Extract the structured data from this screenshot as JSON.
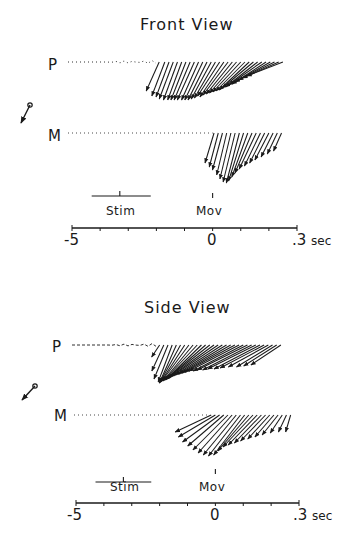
{
  "chart_data": [
    {
      "type": "vector-time-series",
      "title": "Front View",
      "rows": [
        {
          "label": "P",
          "baseline": "dotted, noisy before movement",
          "arrow_onset_sec": -0.2,
          "arrow_end_sec": 0.25,
          "arrows": [
            [
              -0.19,
              13,
              29
            ],
            [
              -0.17,
              13,
              34
            ],
            [
              -0.155,
              13,
              35
            ],
            [
              -0.14,
              14,
              37
            ],
            [
              -0.125,
              14,
              38
            ],
            [
              -0.11,
              14,
              38
            ],
            [
              -0.095,
              15,
              38
            ],
            [
              -0.08,
              16,
              38
            ],
            [
              -0.065,
              17,
              38
            ],
            [
              -0.05,
              17,
              38
            ],
            [
              -0.035,
              18,
              38
            ],
            [
              -0.02,
              19,
              38
            ],
            [
              -0.005,
              20,
              37
            ],
            [
              0.01,
              21,
              36
            ],
            [
              0.025,
              22,
              34
            ],
            [
              0.04,
              24,
              35
            ],
            [
              0.055,
              25,
              33
            ],
            [
              0.07,
              26,
              32
            ],
            [
              0.085,
              27,
              31
            ],
            [
              0.1,
              28,
              30
            ],
            [
              0.115,
              29,
              29
            ],
            [
              0.13,
              30,
              28
            ],
            [
              0.145,
              31,
              26
            ],
            [
              0.16,
              32,
              25
            ],
            [
              0.175,
              33,
              23
            ],
            [
              0.19,
              34,
              22
            ],
            [
              0.205,
              35,
              20
            ],
            [
              0.22,
              36,
              18
            ],
            [
              0.235,
              36,
              16
            ],
            [
              0.25,
              36,
              14
            ]
          ]
        },
        {
          "label": "M",
          "baseline": "dotted",
          "arrow_onset_sec": 0.0,
          "arrow_end_sec": 0.25,
          "arrows": [
            [
              0.005,
              9,
              30
            ],
            [
              0.02,
              9,
              34
            ],
            [
              0.035,
              10,
              37
            ],
            [
              0.05,
              10,
              42
            ],
            [
              0.065,
              11,
              46
            ],
            [
              0.08,
              12,
              49
            ],
            [
              0.095,
              13,
              50
            ],
            [
              0.11,
              15,
              48
            ],
            [
              0.125,
              16,
              44
            ],
            [
              0.14,
              17,
              40
            ],
            [
              0.155,
              17,
              36
            ],
            [
              0.17,
              16,
              33
            ],
            [
              0.185,
              15,
              30
            ],
            [
              0.2,
              14,
              27
            ],
            [
              0.215,
              12,
              24
            ],
            [
              0.23,
              10,
              21
            ],
            [
              0.245,
              8,
              18
            ]
          ]
        }
      ],
      "events": [
        {
          "label": "Stim",
          "time_sec": -0.33,
          "bar_start_sec": -0.43,
          "bar_end_sec": -0.22
        },
        {
          "label": "Mov",
          "time_sec": 0.0
        }
      ],
      "xaxis": {
        "min": -0.5,
        "max": 0.3,
        "tick_step": 0.1,
        "tick_labels": [
          {
            "value": -0.5,
            "text": "-5"
          },
          {
            "value": 0,
            "text": "0"
          },
          {
            "value": 0.3,
            "text": ".3"
          }
        ],
        "unit": "sec"
      },
      "orientation_icon": "reference vector pointing down-left"
    },
    {
      "type": "vector-time-series",
      "title": "Side View",
      "rows": [
        {
          "label": "P",
          "baseline": "dashed, wavy before movement",
          "arrow_onset_sec": -0.2,
          "arrow_end_sec": 0.25,
          "arrows": [
            [
              -0.2,
              8,
              12
            ],
            [
              -0.185,
              12,
              26
            ],
            [
              -0.17,
              14,
              34
            ],
            [
              -0.155,
              14,
              37
            ],
            [
              -0.14,
              17,
              38
            ],
            [
              -0.125,
              21,
              38
            ],
            [
              -0.11,
              24,
              37
            ],
            [
              -0.095,
              27,
              36
            ],
            [
              -0.08,
              30,
              36
            ],
            [
              -0.065,
              33,
              35
            ],
            [
              -0.05,
              36,
              35
            ],
            [
              -0.035,
              39,
              34
            ],
            [
              -0.02,
              42,
              33
            ],
            [
              -0.005,
              44,
              32
            ],
            [
              0.01,
              46,
              31
            ],
            [
              0.025,
              47,
              30
            ],
            [
              0.04,
              48,
              29
            ],
            [
              0.055,
              49,
              28
            ],
            [
              0.07,
              50,
              27
            ],
            [
              0.085,
              50,
              26
            ],
            [
              0.1,
              50,
              26
            ],
            [
              0.115,
              50,
              25
            ],
            [
              0.13,
              49,
              25
            ],
            [
              0.145,
              48,
              24
            ],
            [
              0.16,
              46,
              24
            ],
            [
              0.175,
              44,
              23
            ],
            [
              0.19,
              40,
              22
            ],
            [
              0.205,
              36,
              22
            ],
            [
              0.22,
              33,
              21
            ],
            [
              0.235,
              30,
              20
            ]
          ]
        },
        {
          "label": "M",
          "baseline": "dotted",
          "arrow_onset_sec": -0.02,
          "arrow_end_sec": 0.25,
          "arrows": [
            [
              -0.015,
              36,
              17
            ],
            [
              0.0,
              37,
              22
            ],
            [
              0.015,
              37,
              27
            ],
            [
              0.03,
              36,
              31
            ],
            [
              0.045,
              35,
              35
            ],
            [
              0.06,
              34,
              38
            ],
            [
              0.075,
              33,
              40
            ],
            [
              0.09,
              32,
              41
            ],
            [
              0.105,
              31,
              40
            ],
            [
              0.12,
              31,
              36
            ],
            [
              0.135,
              30,
              32
            ],
            [
              0.15,
              29,
              30
            ],
            [
              0.165,
              27,
              28
            ],
            [
              0.18,
              25,
              26
            ],
            [
              0.195,
              22,
              24
            ],
            [
              0.21,
              19,
              22
            ],
            [
              0.225,
              16,
              20
            ],
            [
              0.24,
              12,
              18
            ],
            [
              0.255,
              8,
              17
            ],
            [
              0.27,
              5,
              17
            ]
          ]
        }
      ],
      "events": [
        {
          "label": "Stim",
          "time_sec": -0.33,
          "bar_start_sec": -0.43,
          "bar_end_sec": -0.23
        },
        {
          "label": "Mov",
          "time_sec": 0.0
        }
      ],
      "xaxis": {
        "min": -0.5,
        "max": 0.3,
        "tick_step": 0.1,
        "tick_labels": [
          {
            "value": -0.5,
            "text": "-5"
          },
          {
            "value": 0,
            "text": "0"
          },
          {
            "value": 0.3,
            "text": ".3"
          }
        ],
        "unit": "sec"
      },
      "orientation_icon": "reference vector pointing down-left"
    }
  ],
  "panels": [
    {
      "title": "Front View",
      "row_labels": [
        "P",
        "M"
      ],
      "stim_label": "Stim",
      "mov_label": "Mov",
      "tick_text": {
        "left": "-5",
        "zero": "0",
        "right": ".3"
      },
      "unit": "sec"
    },
    {
      "title": "Side View",
      "row_labels": [
        "P",
        "M"
      ],
      "stim_label": "Stim",
      "mov_label": "Mov",
      "tick_text": {
        "left": "-5",
        "zero": "0",
        "right": ".3"
      },
      "unit": "sec"
    }
  ],
  "colors": {
    "ink": "#1a1a1a",
    "background": "#ffffff"
  }
}
